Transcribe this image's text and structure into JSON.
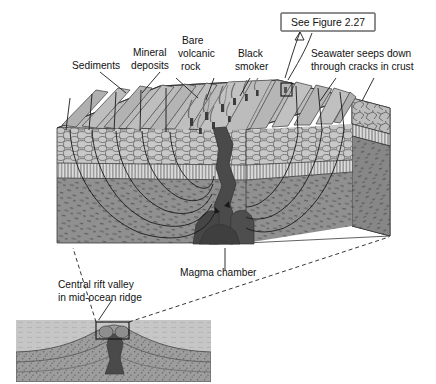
{
  "figure": {
    "background_color": "#ffffff"
  },
  "callout": {
    "label": "See Figure 2.27",
    "box_color": "#ffffff",
    "border_color": "#1d1d1d"
  },
  "labels": {
    "sediments": "Sediments",
    "mineral_deposits_line1": "Mineral",
    "mineral_deposits_line2": "deposits",
    "bare_volcanic_rock_line1": "Bare",
    "bare_volcanic_rock_line2": "volcanic",
    "bare_volcanic_rock_line3": "rock",
    "black_smoker_line1": "Black",
    "black_smoker_line2": "smoker",
    "seawater_line1": "Seawater seeps down",
    "seawater_line2": "through cracks in crust",
    "magma_chamber": "Magma chamber",
    "central_rift_line1": "Central rift valley",
    "central_rift_line2": "in mid-ocean ridge"
  },
  "colors": {
    "seafloor_top": "#b9b9b9",
    "seafloor_top_light": "#cccccc",
    "ridge_flank": "#a6a6a6",
    "pillow_lava": "#c4c4c4",
    "sheeted_dikes": "#d8d8d8",
    "gabbro": "#8f8f8f",
    "gabbro_dark": "#858585",
    "magma": "#4a4a4a",
    "magma_dark": "#3d3d3d",
    "side_face": "#9a9a9a",
    "side_face_dark": "#8a8a8a",
    "inset_water": "#c9c9c9",
    "inset_crust": "#999999",
    "line": "#1a1a1a"
  },
  "inset": {
    "name": "mid-ocean-ridge-cross-section",
    "marker_label": "detail region"
  },
  "features": {
    "black_smoker_count": 9,
    "seawater_arrow_count": 2,
    "circulation_arrow_count": 8
  }
}
